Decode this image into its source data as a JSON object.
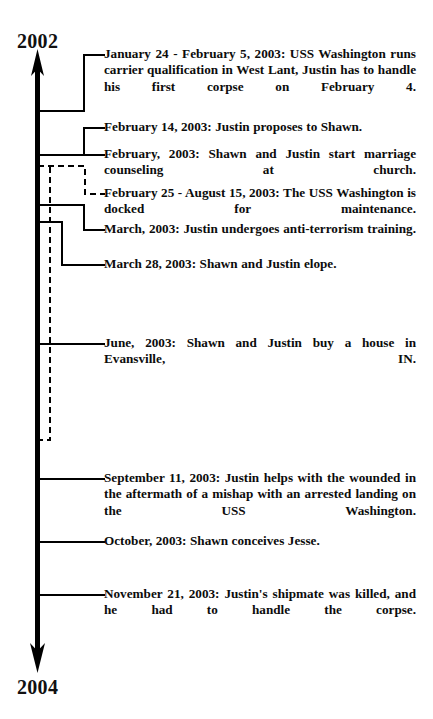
{
  "diagram": {
    "type": "timeline",
    "title": "",
    "orientation": "vertical",
    "axis": {
      "start_label": "2002",
      "end_label": "2004",
      "start_arrow": true,
      "end_arrow": true,
      "color": "#000000"
    },
    "range_bracket": {
      "style": "dashed",
      "label_ref": "feb25-aug15-2003",
      "description": "February 25 - August 15, 2003 docking period"
    },
    "events": [
      {
        "id": "jan24-feb5-2003",
        "date": "January 24 - February 5, 2003",
        "text": "January 24 - February 5, 2003:  USS Washington runs carrier qualification in West Lant, Justin has to handle his first corpse on February 4.",
        "connector": "elbow",
        "line_style": "solid"
      },
      {
        "id": "feb14-2003",
        "date": "February 14, 2003",
        "text": "February 14, 2003:  Justin proposes to Shawn.",
        "connector": "elbow",
        "line_style": "solid"
      },
      {
        "id": "feb-2003",
        "date": "February, 2003",
        "text": "February, 2003:  Shawn and Justin start marriage counseling at church.",
        "connector": "straight",
        "line_style": "solid"
      },
      {
        "id": "feb25-aug15-2003",
        "date": "February 25 - August 15, 2003",
        "text": "February 25 - August 15, 2003:  The USS Washington is docked for maintenance.",
        "connector": "elbow",
        "line_style": "dashed"
      },
      {
        "id": "mar-2003",
        "date": "March, 2003",
        "text": "March, 2003:  Justin undergoes anti-terrorism training.",
        "connector": "elbow",
        "line_style": "solid"
      },
      {
        "id": "mar28-2003",
        "date": "March 28, 2003",
        "text": "March 28, 2003:  Shawn and Justin elope.",
        "connector": "elbow",
        "line_style": "solid"
      },
      {
        "id": "jun-2003",
        "date": "June, 2003",
        "text": "June, 2003:  Shawn and Justin buy a house in Evansville, IN.",
        "connector": "straight",
        "line_style": "solid"
      },
      {
        "id": "sep11-2003",
        "date": "September 11, 2003",
        "text": "September 11, 2003:  Justin helps with the wounded in the aftermath of a mishap with an arrested landing on the USS Washington.",
        "connector": "straight",
        "line_style": "solid"
      },
      {
        "id": "oct-2003",
        "date": "October, 2003",
        "text": "October, 2003: Shawn conceives Jesse.",
        "connector": "straight",
        "line_style": "solid"
      },
      {
        "id": "nov21-2003",
        "date": "November 21, 2003",
        "text": "November 21, 2003:  Justin's shipmate was killed, and he had to handle the corpse.",
        "connector": "straight",
        "line_style": "solid"
      }
    ]
  }
}
